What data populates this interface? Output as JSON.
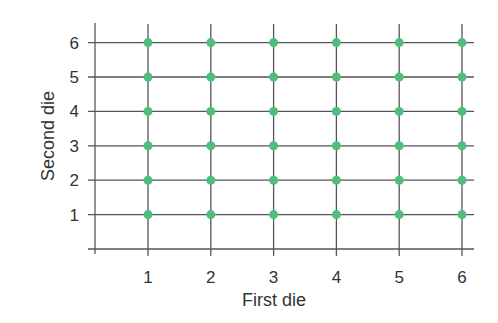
{
  "chart_data": {
    "type": "scatter",
    "title": "",
    "xlabel": "First die",
    "ylabel": "Second die",
    "x_ticks": [
      1,
      2,
      3,
      4,
      5,
      6
    ],
    "y_ticks": [
      1,
      2,
      3,
      4,
      5,
      6
    ],
    "xlim": [
      0,
      6.2
    ],
    "ylim": [
      0,
      6.2
    ],
    "grid": true,
    "legend": null,
    "series": [
      {
        "name": "outcomes",
        "color": "#4dbf7a",
        "points": [
          [
            1,
            1
          ],
          [
            2,
            1
          ],
          [
            3,
            1
          ],
          [
            4,
            1
          ],
          [
            5,
            1
          ],
          [
            6,
            1
          ],
          [
            1,
            2
          ],
          [
            2,
            2
          ],
          [
            3,
            2
          ],
          [
            4,
            2
          ],
          [
            5,
            2
          ],
          [
            6,
            2
          ],
          [
            1,
            3
          ],
          [
            2,
            3
          ],
          [
            3,
            3
          ],
          [
            4,
            3
          ],
          [
            5,
            3
          ],
          [
            6,
            3
          ],
          [
            1,
            4
          ],
          [
            2,
            4
          ],
          [
            3,
            4
          ],
          [
            4,
            4
          ],
          [
            5,
            4
          ],
          [
            6,
            4
          ],
          [
            1,
            5
          ],
          [
            2,
            5
          ],
          [
            3,
            5
          ],
          [
            4,
            5
          ],
          [
            5,
            5
          ],
          [
            6,
            5
          ],
          [
            1,
            6
          ],
          [
            2,
            6
          ],
          [
            3,
            6
          ],
          [
            4,
            6
          ],
          [
            5,
            6
          ],
          [
            6,
            6
          ]
        ]
      }
    ]
  },
  "colors": {
    "point": "#4dbf7a",
    "grid": "#555555",
    "text": "#333333"
  }
}
